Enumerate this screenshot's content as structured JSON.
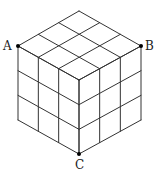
{
  "diagram": {
    "type": "cube-grid",
    "grid_size": 3,
    "line_color": "#333333",
    "point_color": "#000000",
    "vertices": {
      "top": [
        79,
        11
      ],
      "left_top": [
        18,
        46
      ],
      "right_top": [
        141,
        46
      ],
      "center": [
        79,
        80
      ],
      "left_bottom": [
        18,
        120
      ],
      "right_bottom": [
        141,
        120
      ],
      "bottom": [
        79,
        154
      ]
    },
    "points": [
      {
        "name": "A",
        "x": 18,
        "y": 46,
        "label_x": 3,
        "label_y": 50
      },
      {
        "name": "B",
        "x": 141,
        "y": 46,
        "label_x": 145,
        "label_y": 50
      },
      {
        "name": "C",
        "x": 79,
        "y": 154,
        "label_x": 75,
        "label_y": 169
      }
    ]
  }
}
